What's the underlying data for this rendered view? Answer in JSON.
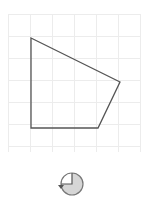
{
  "canvas": {
    "background": "#ffffff",
    "grid": {
      "x0": 8,
      "y0": 14,
      "x1": 140,
      "y1": 152,
      "step": 22,
      "color": "#ececec"
    },
    "shape": {
      "type": "polygon",
      "points": [
        [
          31,
          38
        ],
        [
          120,
          82
        ],
        [
          98,
          128
        ],
        [
          31,
          128
        ]
      ],
      "stroke": "#555555",
      "fill": "none"
    }
  },
  "rotate_handle": {
    "cx": 72,
    "cy": 184,
    "r": 11,
    "fill": "#d6d6d6",
    "stroke": "#777777",
    "icon": "rotate-icon"
  }
}
